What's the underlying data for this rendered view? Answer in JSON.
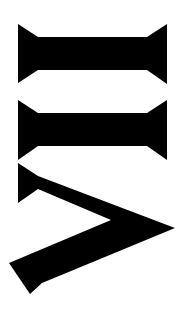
{
  "image": {
    "description": "Roman numeral rotated 90 degrees",
    "numeral": "VII",
    "rotation_deg": 90,
    "background": "#ffffff",
    "glyph_color": "#000000",
    "glyphs": [
      {
        "char": "I",
        "name": "numeral-i-first"
      },
      {
        "char": "I",
        "name": "numeral-i-second"
      },
      {
        "char": "V",
        "name": "numeral-v"
      }
    ]
  }
}
